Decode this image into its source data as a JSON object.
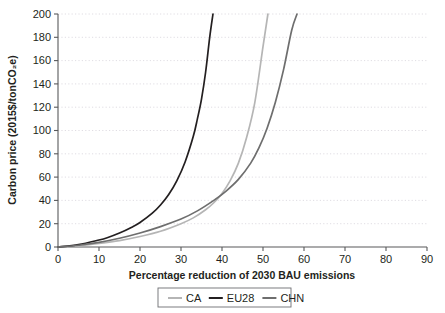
{
  "chart_data": {
    "type": "line",
    "title": "",
    "xlabel": "Percentage reduction of 2030 BAU emissions",
    "ylabel": "Carbon price (2015$/tonCO₂e)",
    "xlim": [
      0,
      90
    ],
    "ylim": [
      0,
      200
    ],
    "xticks": [
      0,
      10,
      20,
      30,
      40,
      50,
      60,
      70,
      80,
      90
    ],
    "yticks": [
      0,
      20,
      40,
      60,
      80,
      100,
      120,
      140,
      160,
      180,
      200
    ],
    "grid": "horizontal-dotted",
    "legend_position": "below-axis-centered",
    "series": [
      {
        "name": "CA",
        "color": "#b5b5b5",
        "x": [
          0,
          5,
          10,
          15,
          20,
          25,
          30,
          33,
          36,
          38,
          40,
          42,
          44,
          46,
          48,
          50,
          51.2
        ],
        "values": [
          0,
          1,
          3,
          5.5,
          9,
          13.5,
          20,
          25,
          32,
          38,
          46,
          57,
          72,
          94,
          124,
          172,
          200
        ]
      },
      {
        "name": "EU28",
        "color": "#231f20",
        "x": [
          0,
          5,
          10,
          12,
          15,
          18,
          20,
          23,
          25,
          27,
          29,
          31,
          33,
          34,
          35,
          36,
          37,
          37.8
        ],
        "values": [
          0,
          2,
          6,
          8,
          12,
          17,
          21,
          29,
          36,
          45,
          57,
          73,
          95,
          110,
          127,
          150,
          180,
          200
        ]
      },
      {
        "name": "CHN",
        "color": "#6e6e6e",
        "x": [
          0,
          5,
          10,
          15,
          20,
          25,
          30,
          34,
          38,
          41,
          44,
          47,
          49,
          51,
          53,
          55,
          57,
          58.3
        ],
        "values": [
          0,
          1.5,
          4,
          7.5,
          12,
          17.5,
          24,
          31,
          40,
          48,
          58,
          72,
          85,
          102,
          124,
          152,
          186,
          200
        ]
      }
    ]
  },
  "legend": {
    "items": [
      {
        "label": "CA"
      },
      {
        "label": "EU28"
      },
      {
        "label": "CHN"
      }
    ]
  },
  "axes": {
    "x_title": "Percentage reduction of 2030 BAU emissions",
    "y_title": "Carbon price (2015$/tonCO₂e)"
  }
}
